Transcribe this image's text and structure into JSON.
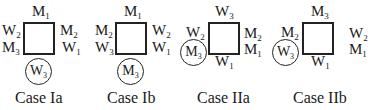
{
  "diagram": {
    "cases": [
      {
        "caption": "Case Ia",
        "top": {
          "l": "M",
          "s": "1"
        },
        "left": [
          {
            "l": "W",
            "s": "2"
          },
          {
            "l": "M",
            "s": "3"
          }
        ],
        "right": [
          {
            "l": "M",
            "s": "2"
          },
          {
            "l": "W",
            "s": "1"
          }
        ],
        "bottom": null,
        "circled": {
          "l": "W",
          "s": "3",
          "position": "below"
        }
      },
      {
        "caption": "Case Ib",
        "top": {
          "l": "M",
          "s": "1"
        },
        "left": [
          {
            "l": "M",
            "s": "2"
          },
          {
            "l": "W",
            "s": "3"
          }
        ],
        "right": [
          {
            "l": "W",
            "s": "2"
          },
          {
            "l": "W",
            "s": "1"
          }
        ],
        "bottom": null,
        "circled": {
          "l": "M",
          "s": "3",
          "position": "below"
        }
      },
      {
        "caption": "Case IIa",
        "top": {
          "l": "W",
          "s": "3"
        },
        "left": [
          {
            "l": "W",
            "s": "2"
          }
        ],
        "right": [
          {
            "l": "M",
            "s": "2"
          },
          {
            "l": "M",
            "s": "1"
          }
        ],
        "bottom": {
          "l": "W",
          "s": "1"
        },
        "circled": {
          "l": "M",
          "s": "3",
          "position": "left"
        }
      },
      {
        "caption": "Case IIb",
        "top": {
          "l": "M",
          "s": "3"
        },
        "left": [
          {
            "l": "M",
            "s": "2"
          }
        ],
        "right": [
          {
            "l": "W",
            "s": "2"
          },
          {
            "l": "M",
            "s": "1"
          }
        ],
        "bottom": {
          "l": "W",
          "s": "1"
        },
        "circled": {
          "l": "W",
          "s": "3",
          "position": "left"
        }
      }
    ]
  }
}
